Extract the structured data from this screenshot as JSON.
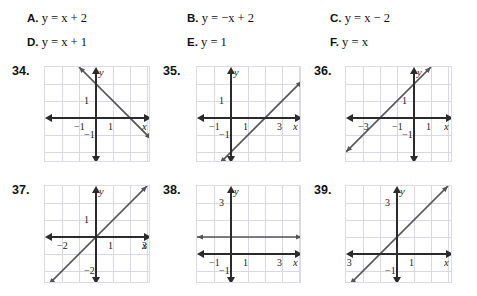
{
  "choices": [
    {
      "id": "A",
      "label": "A.",
      "equation": "y = x + 2"
    },
    {
      "id": "B",
      "label": "B.",
      "equation": "y = −x + 2"
    },
    {
      "id": "C",
      "label": "C.",
      "equation": "y = x − 2"
    },
    {
      "id": "D",
      "label": "D.",
      "equation": "y = x + 1"
    },
    {
      "id": "E",
      "label": "E.",
      "equation": "y = 1"
    },
    {
      "id": "F",
      "label": "F.",
      "equation": "y = x"
    }
  ],
  "panels": [
    {
      "number": "34.",
      "axis_x_label": "x",
      "axis_y_label": "y",
      "ticks": [
        {
          "text": "1",
          "axis": "y",
          "value": 1
        },
        {
          "text": "−1",
          "axis": "x",
          "value": -1
        },
        {
          "text": "1",
          "axis": "x",
          "value": 1
        },
        {
          "text": "−1",
          "axis": "y",
          "value": -1
        }
      ],
      "line": {
        "slope": -1,
        "intercept": 2
      }
    },
    {
      "number": "35.",
      "axis_x_label": "x",
      "axis_y_label": "y",
      "ticks": [
        {
          "text": "1",
          "axis": "y",
          "value": 1
        },
        {
          "text": "−1",
          "axis": "x",
          "value": -1
        },
        {
          "text": "1",
          "axis": "x",
          "value": 1
        },
        {
          "text": "3",
          "axis": "x",
          "value": 3
        },
        {
          "text": "−1",
          "axis": "y",
          "value": -1
        }
      ],
      "line": {
        "slope": 1,
        "intercept": -2
      }
    },
    {
      "number": "36.",
      "axis_x_label": "x",
      "axis_y_label": "y",
      "ticks": [
        {
          "text": "1",
          "axis": "y",
          "value": 1
        },
        {
          "text": "−3",
          "axis": "x",
          "value": -3
        },
        {
          "text": "−1",
          "axis": "x",
          "value": -1
        },
        {
          "text": "1",
          "axis": "x",
          "value": 1
        },
        {
          "text": "−1",
          "axis": "y",
          "value": -1
        }
      ],
      "line": {
        "slope": 1,
        "intercept": 2
      }
    },
    {
      "number": "37.",
      "axis_x_label": "x",
      "axis_y_label": "y",
      "ticks": [
        {
          "text": "1",
          "axis": "y",
          "value": 1
        },
        {
          "text": "−2",
          "axis": "x",
          "value": -2
        },
        {
          "text": "1",
          "axis": "x",
          "value": 1
        },
        {
          "text": "3",
          "axis": "x",
          "value": 3
        },
        {
          "text": "−2",
          "axis": "y",
          "value": -2
        }
      ],
      "line": {
        "slope": 1,
        "intercept": 0
      }
    },
    {
      "number": "38.",
      "axis_x_label": "x",
      "axis_y_label": "y",
      "ticks": [
        {
          "text": "3",
          "axis": "y",
          "value": 3
        },
        {
          "text": "−1",
          "axis": "x",
          "value": -1
        },
        {
          "text": "1",
          "axis": "x",
          "value": 1
        },
        {
          "text": "3",
          "axis": "x",
          "value": 3
        },
        {
          "text": "−1",
          "axis": "y",
          "value": -1
        }
      ],
      "line": {
        "slope": 0,
        "intercept": 1
      }
    },
    {
      "number": "39.",
      "axis_x_label": "x",
      "axis_y_label": "y",
      "ticks": [
        {
          "text": "3",
          "axis": "y",
          "value": 3
        },
        {
          "text": "−3",
          "axis": "x",
          "value": -3
        },
        {
          "text": "1",
          "axis": "x",
          "value": 1
        },
        {
          "text": "−1",
          "axis": "y",
          "value": -1
        }
      ],
      "line": {
        "slope": 1,
        "intercept": 1
      }
    }
  ],
  "colors": {
    "grid": "#d9d7e2",
    "axis": "#2b2b2b",
    "function_line": "#555555",
    "text": "#111111",
    "background": "#ffffff"
  },
  "layout": {
    "panel_geometry": [
      {
        "num": "34.",
        "numX": 12,
        "numY": 64,
        "gx": 44,
        "gy": 66,
        "gw": 106,
        "gh": 96,
        "ox": 3,
        "oy": 3,
        "cell": 17.0
      },
      {
        "num": "35.",
        "numX": 163,
        "numY": 64,
        "gx": 196,
        "gy": 66,
        "gw": 105,
        "gh": 96,
        "ox": 2,
        "oy": 3,
        "cell": 17.0
      },
      {
        "num": "36.",
        "numX": 314,
        "numY": 64,
        "gx": 345,
        "gy": 66,
        "gw": 107,
        "gh": 96,
        "ox": 4,
        "oy": 3,
        "cell": 17.0
      },
      {
        "num": "37.",
        "numX": 12,
        "numY": 183,
        "gx": 44,
        "gy": 185,
        "gw": 106,
        "gh": 98,
        "ox": 3,
        "oy": 3,
        "cell": 17.0
      },
      {
        "num": "38.",
        "numX": 163,
        "numY": 183,
        "gx": 196,
        "gy": 185,
        "gw": 105,
        "gh": 98,
        "ox": 2,
        "oy": 4,
        "cell": 17.0
      },
      {
        "num": "39.",
        "numX": 314,
        "numY": 183,
        "gx": 345,
        "gy": 185,
        "gw": 107,
        "gh": 98,
        "ox": 3,
        "oy": 4,
        "cell": 17.0
      }
    ]
  }
}
